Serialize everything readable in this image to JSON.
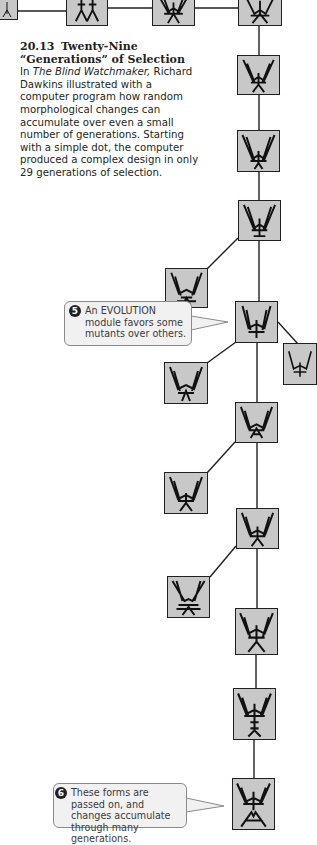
{
  "figure": {
    "number": "20.13",
    "title": "Twenty-Nine “Generations” of Selection",
    "caption_intro": "In ",
    "book_title": "The Blind Watchmaker,",
    "caption_body": " Richard Dawkins illustrated with a computer program how random morphological changes can accumulate over even a small number of generations. Starting with a simple dot, the computer produced a complex design in only 29 generations of selection."
  },
  "callouts": [
    {
      "number": "5",
      "text_prefix": "An ",
      "text_smallcaps": "EVOLUTION",
      "text_suffix": " module favors some mutants over others."
    },
    {
      "number": "6",
      "text": "These forms are passed on, and changes accumulate through many generations."
    }
  ],
  "colors": {
    "box_fill": "#c8c8c8",
    "line": "#231f20",
    "callout_fill": "#f1f1f1",
    "callout_border": "#8a8a8a"
  },
  "biomorphs": {
    "count_visible": 20,
    "icon": "biomorph-icon"
  }
}
